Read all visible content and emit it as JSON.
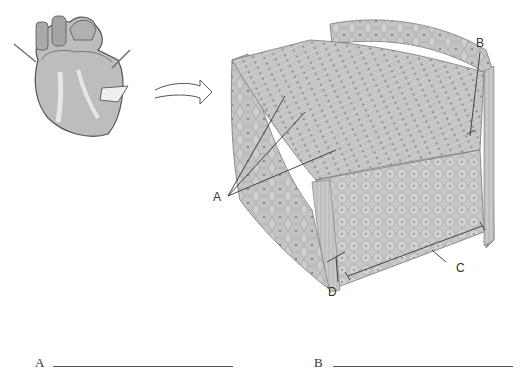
{
  "figure": {
    "labels": {
      "A": "A",
      "B": "B",
      "C": "C",
      "D": "D"
    }
  },
  "answers": [
    {
      "letter": "A",
      "value": ""
    },
    {
      "letter": "B",
      "value": ""
    }
  ],
  "colors": {
    "ink": "#333333",
    "tissue_light": "#d6d6d6",
    "tissue_mid": "#b5b5b5",
    "tissue_dark": "#8a8a8a"
  }
}
